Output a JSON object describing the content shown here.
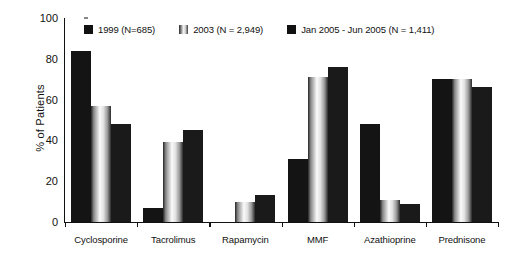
{
  "chart_data": {
    "type": "bar",
    "title": "",
    "xlabel": "",
    "ylabel": "% of Patients",
    "ylim": [
      0,
      100
    ],
    "yticks": [
      0,
      20,
      40,
      60,
      80,
      100
    ],
    "grid": false,
    "legend_position": "top",
    "categories": [
      "Cyclosporine",
      "Tacrolimus",
      "Rapamycin",
      "MMF",
      "Azathioprine",
      "Prednisone"
    ],
    "series": [
      {
        "name": "1999 (N=685)",
        "swatch": "solid-black",
        "color": "#141414",
        "values": [
          84,
          7,
          0,
          31,
          48,
          70
        ]
      },
      {
        "name": "2003 (N = 2,949)",
        "swatch": "gradient-light",
        "color": "#e8e8e8",
        "values": [
          57,
          39,
          10,
          71,
          11,
          70
        ]
      },
      {
        "name": "Jan 2005 - Jun 2005 (N = 1,411)",
        "swatch": "solid-black",
        "color": "#1a1a1a",
        "values": [
          48,
          45,
          13,
          76,
          9,
          66
        ]
      }
    ]
  }
}
